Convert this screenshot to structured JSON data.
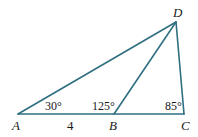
{
  "diagram": {
    "type": "triangle-geometry",
    "line_color": "#2f6f80",
    "points": {
      "A": {
        "label": "A",
        "x": 18,
        "y": 114
      },
      "B": {
        "label": "B",
        "x": 114,
        "y": 114
      },
      "C": {
        "label": "C",
        "x": 184,
        "y": 114
      },
      "D": {
        "label": "D",
        "x": 176,
        "y": 22
      }
    },
    "segments": [
      "AB",
      "BC",
      "CD",
      "AD",
      "BD"
    ],
    "angles": {
      "A": "30°",
      "ABD": "125°",
      "C": "85°"
    },
    "lengths": {
      "AB": "4"
    }
  }
}
